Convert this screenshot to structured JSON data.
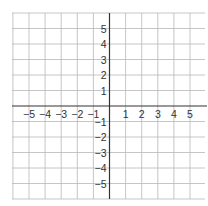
{
  "graph": {
    "type": "coordinate-plane",
    "x_range": [
      -6,
      6
    ],
    "y_range": [
      -6,
      6
    ],
    "grid_step": 1,
    "x_tick_labels": [
      "−5",
      "−4",
      "−3",
      "−2",
      "−1",
      "1",
      "2",
      "3",
      "4",
      "5"
    ],
    "x_tick_values": [
      -5,
      -4,
      -3,
      -2,
      -1,
      1,
      2,
      3,
      4,
      5
    ],
    "y_tick_labels": [
      "5",
      "4",
      "3",
      "2",
      "1",
      "−1",
      "−2",
      "−3",
      "−4",
      "−5"
    ],
    "y_tick_values": [
      5,
      4,
      3,
      2,
      1,
      -1,
      -2,
      -3,
      -4,
      -5
    ],
    "colors": {
      "grid": "#b8b8b8",
      "axis": "#333333",
      "label": "#333333",
      "background": "#ffffff"
    }
  }
}
